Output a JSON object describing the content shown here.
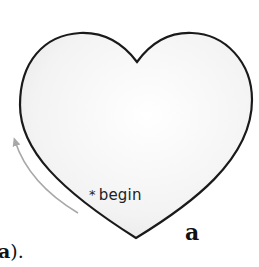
{
  "figure": {
    "shape": "heart",
    "stroke_color": "#1a1a1a",
    "fill_color": "#f2f2f2",
    "arrow_color": "#a8a8a8",
    "start_marker": "*",
    "start_label": "begin",
    "panel_label": "a"
  },
  "caption": {
    "bold_text": "a",
    "trailing_text": ")."
  }
}
